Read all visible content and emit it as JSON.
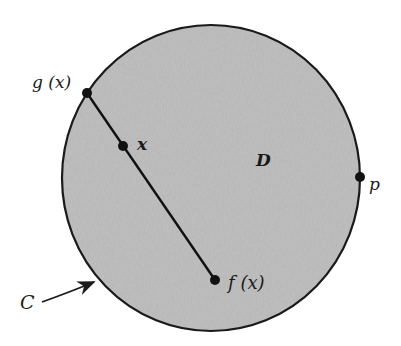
{
  "diagram": {
    "region": {
      "label": "D",
      "boundary_label": "C",
      "fill": "#b9b9b9",
      "stroke": "#1a1a1a",
      "cx": 211,
      "cy": 178,
      "rx": 149,
      "ry": 153
    },
    "points": [
      {
        "id": "g",
        "label": "g (x)",
        "x": 87,
        "y": 93
      },
      {
        "id": "x",
        "label": "x",
        "x": 123,
        "y": 146
      },
      {
        "id": "f",
        "label": "f (x)",
        "x": 215,
        "y": 280
      },
      {
        "id": "p",
        "label": "p",
        "x": 360,
        "y": 177
      }
    ],
    "segment": {
      "from": "g",
      "to": "f"
    },
    "labels": {
      "g": "g (x)",
      "x": "x",
      "f": "f (x)",
      "p": "p",
      "D": "D",
      "C": "C"
    }
  }
}
